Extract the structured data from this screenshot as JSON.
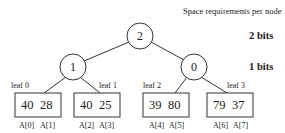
{
  "legend": {
    "title": "Space requirements per node",
    "levels": [
      "2 bits",
      "1 bits"
    ]
  },
  "tree": {
    "root": {
      "label": "2"
    },
    "internal": [
      {
        "label": "1"
      },
      {
        "label": "0"
      }
    ],
    "leaves": [
      {
        "label": "leaf  0",
        "values": [
          "40",
          "28"
        ],
        "indices": [
          "A[0]",
          "A[1]"
        ]
      },
      {
        "label": "leaf  1",
        "values": [
          "40",
          "25"
        ],
        "indices": [
          "A[2]",
          "A[3]"
        ]
      },
      {
        "label": "leaf  2",
        "values": [
          "39",
          "80"
        ],
        "indices": [
          "A[4]",
          "A[5]"
        ]
      },
      {
        "label": "leaf  3",
        "values": [
          "79",
          "37"
        ],
        "indices": [
          "A[6]",
          "A[7]"
        ]
      }
    ]
  },
  "colors": {
    "stroke": "#333333",
    "background": "#ffffff"
  }
}
